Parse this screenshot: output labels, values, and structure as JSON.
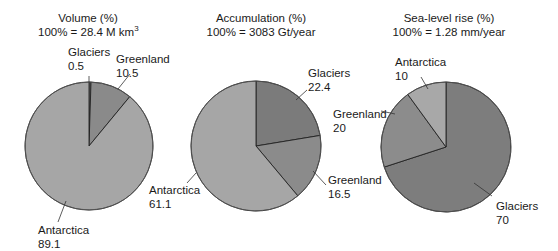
{
  "chart_data": [
    {
      "type": "pie",
      "title": "Volume (%)",
      "subtitle": "100% = 28.4 M km",
      "subtitle_sup": "3",
      "categories": [
        "Glaciers",
        "Greenland",
        "Antarctica"
      ],
      "values": [
        0.5,
        10.5,
        89.1
      ],
      "colors": [
        "#7a7a7a",
        "#8a8a8a",
        "#a6a6a6"
      ],
      "start_angle_deg": 0,
      "direction": "clockwise"
    },
    {
      "type": "pie",
      "title": "Accumulation (%)",
      "subtitle": "100% = 3083 Gt/year",
      "categories": [
        "Glaciers",
        "Greenland",
        "Antarctica"
      ],
      "values": [
        22.4,
        16.5,
        61.1
      ],
      "colors": [
        "#7b7b7b",
        "#8b8b8b",
        "#a6a6a6"
      ],
      "start_angle_deg": 0,
      "direction": "clockwise"
    },
    {
      "type": "pie",
      "title": "Sea-level rise (%)",
      "subtitle": "100% = 1.28 mm/year",
      "categories": [
        "Glaciers",
        "Greenland",
        "Antarctica"
      ],
      "values": [
        70,
        20,
        10
      ],
      "colors": [
        "#7d7d7d",
        "#8c8c8c",
        "#a8a8a8"
      ],
      "start_angle_deg": 0,
      "direction": "clockwise"
    }
  ],
  "labels": {
    "p1": {
      "glaciers": {
        "name": "Glaciers",
        "value": "0.5"
      },
      "greenland": {
        "name": "Greenland",
        "value": "10.5"
      },
      "antarctica": {
        "name": "Antarctica",
        "value": "89.1"
      }
    },
    "p2": {
      "glaciers": {
        "name": "Glaciers",
        "value": "22.4"
      },
      "greenland": {
        "name": "Greenland",
        "value": "16.5"
      },
      "antarctica": {
        "name": "Antarctica",
        "value": "61.1"
      }
    },
    "p3": {
      "glaciers": {
        "name": "Glaciers",
        "value": "70"
      },
      "greenland": {
        "name": "Greenland",
        "value": "20"
      },
      "antarctica": {
        "name": "Antarctica",
        "value": "10"
      }
    }
  }
}
